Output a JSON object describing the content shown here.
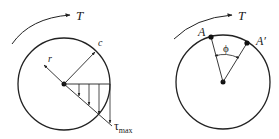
{
  "colors": {
    "stroke": "#222222",
    "background": "#ffffff"
  },
  "left_figure": {
    "torque_label": "T",
    "outer_radius_label": "c",
    "radius_label": "r",
    "stress_symbol": "τ",
    "stress_subscript": "max",
    "stress_arrow_count": 4
  },
  "right_figure": {
    "torque_label": "T",
    "point_a_label": "A",
    "point_a_prime_label": "A′",
    "angle_label": "ϕ"
  }
}
